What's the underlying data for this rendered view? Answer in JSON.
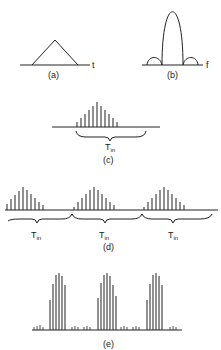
{
  "panels": {
    "a": {
      "label": "(a)",
      "axis": "t",
      "shape": "triangle"
    },
    "b": {
      "label": "(b)",
      "axis": "f",
      "shape": "sinc-squared spectrum"
    },
    "c": {
      "label": "(c)",
      "brace_label": "T",
      "brace_sub": "in"
    },
    "d": {
      "label": "(d)",
      "brace_labels": [
        {
          "main": "T",
          "sub": "in"
        },
        {
          "main": "T",
          "sub": "in"
        },
        {
          "main": "T",
          "sub": "in"
        }
      ]
    },
    "e": {
      "label": "(e)"
    }
  },
  "colors": {
    "ink": "#222222",
    "background": "#ffffff"
  }
}
